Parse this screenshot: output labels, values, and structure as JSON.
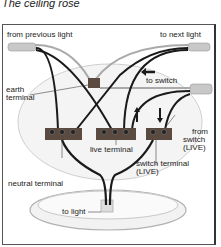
{
  "title": "The ceiling rose",
  "labels": {
    "from_previous_light": "from previous light",
    "to_next_light": "to next light",
    "to_switch": "to switch",
    "earth_terminal_1": "earth",
    "earth_terminal_2": "terminal",
    "live_terminal": "live terminal",
    "from_switch_1": "from",
    "from_switch_2": "switch",
    "from_switch_3": "(LIVE)",
    "switch_terminal_1": "switch terminal",
    "switch_terminal_2": "(LIVE)",
    "neutral_terminal": "neutral terminal",
    "to_light": "to light"
  },
  "colors": {
    "wire_black": "#1a1a1a",
    "wire_grey": "#999999",
    "terminal_block": "#5a4a40",
    "cable_sheath": "#c8c8c8"
  }
}
